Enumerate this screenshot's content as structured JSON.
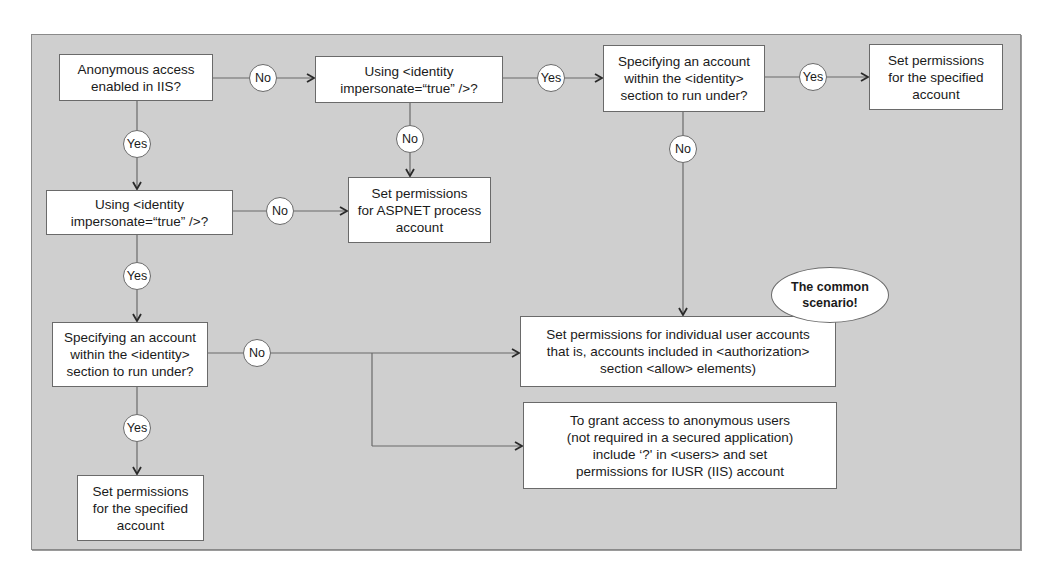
{
  "diagram": {
    "type": "flowchart",
    "nodes": {
      "q_anonymous": "Anonymous access\nenabled in IIS?",
      "q_impersonate_top": "Using <identity\nimpersonate=“true” />?",
      "q_specify_top": "Specifying an account\nwithin the <identity>\nsection to run under?",
      "set_specified_top": "Set permissions\nfor the specified\naccount",
      "set_aspnet": "Set permissions\nfor ASPNET process\naccount",
      "q_impersonate_left": "Using <identity\nimpersonate=“true” />?",
      "q_specify_left": "Specifying an account\nwithin the <identity>\nsection to run under?",
      "set_specified_bottom": "Set permissions\nfor the specified\naccount",
      "set_individual": "Set permissions for individual user accounts\nthat is, accounts included in <authorization>\nsection <allow> elements)",
      "grant_anonymous": "To grant access to anonymous users\n(not required in a secured application)\ninclude ‘?' in <users> and set\npermissions for IUSR (IIS) account"
    },
    "labels": {
      "no_1": "No",
      "yes_1": "Yes",
      "yes_2": "Yes",
      "no_2": "No",
      "no_3": "No",
      "no_4": "No",
      "yes_3": "Yes",
      "no_5": "No",
      "yes_4": "Yes"
    },
    "callout": "The common\nscenario!",
    "edges": [
      {
        "from": "q_anonymous",
        "to": "q_impersonate_top",
        "label": "No"
      },
      {
        "from": "q_anonymous",
        "to": "q_impersonate_left",
        "label": "Yes"
      },
      {
        "from": "q_impersonate_top",
        "to": "q_specify_top",
        "label": "Yes"
      },
      {
        "from": "q_impersonate_top",
        "to": "set_aspnet",
        "label": "No"
      },
      {
        "from": "q_specify_top",
        "to": "set_specified_top",
        "label": "Yes"
      },
      {
        "from": "q_specify_top",
        "to": "set_individual",
        "label": "No"
      },
      {
        "from": "q_impersonate_left",
        "to": "set_aspnet",
        "label": "No"
      },
      {
        "from": "q_impersonate_left",
        "to": "q_specify_left",
        "label": "Yes"
      },
      {
        "from": "q_specify_left",
        "to": "set_individual",
        "label": "No"
      },
      {
        "from": "q_specify_left",
        "to": "grant_anonymous",
        "label": "No"
      },
      {
        "from": "q_specify_left",
        "to": "set_specified_bottom",
        "label": "Yes"
      }
    ]
  },
  "colors": {
    "background": "#cfcfcf",
    "box_fill": "#ffffff",
    "line": "#6a6a6a"
  }
}
